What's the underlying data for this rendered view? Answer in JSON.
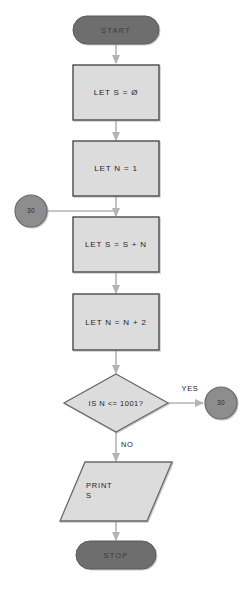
{
  "diagram": {
    "colors": {
      "terminal_fill": "#6e6e6e",
      "terminal_stroke": "#5a5a5a",
      "process_fill": "#dcdcdc",
      "process_stroke": "#4a4a4a",
      "decision_fill": "#dcdcdc",
      "decision_stroke": "#6a6a6a",
      "io_fill": "#dcdcdc",
      "io_stroke": "#6a6a6a",
      "connector_fill": "#8d8d8d",
      "connector_stroke": "#6a6a6a",
      "arrow": "#b4b4b4",
      "background": "#ffffff"
    },
    "nodes": [
      {
        "id": "start",
        "shape": "terminal",
        "label": "START"
      },
      {
        "id": "let_s_0",
        "shape": "process",
        "label": "LET S = Ø"
      },
      {
        "id": "let_n_1",
        "shape": "process",
        "label": "LET N = 1"
      },
      {
        "id": "conn_in",
        "shape": "connector",
        "label": "30"
      },
      {
        "id": "let_s_sn",
        "shape": "process",
        "label": "LET S = S + N"
      },
      {
        "id": "let_n_n2",
        "shape": "process",
        "label": "LET N = N + 2"
      },
      {
        "id": "decision",
        "shape": "decision",
        "label": "IS N <= 1001?"
      },
      {
        "id": "conn_out",
        "shape": "connector",
        "label": "30"
      },
      {
        "id": "print_s",
        "shape": "io",
        "label": "PRINT\nS"
      },
      {
        "id": "stop",
        "shape": "terminal",
        "label": "STOP"
      }
    ],
    "edge_labels": {
      "yes": "YES",
      "no": "NO"
    }
  }
}
